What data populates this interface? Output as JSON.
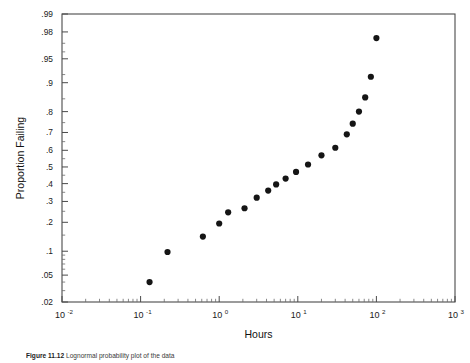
{
  "figure": {
    "caption_label": "Figure 11.12",
    "caption_text": "Lognormal probability plot of the data"
  },
  "chart_data": {
    "type": "scatter",
    "title": "",
    "subtitle": "",
    "xlabel": "Hours",
    "ylabel": "Proportion Failing",
    "x_scale": "log10",
    "y_scale": "normal-probability",
    "grid": false,
    "legend": null,
    "xlim": [
      0.01,
      1000
    ],
    "ylim": [
      0.02,
      0.99
    ],
    "x_ticks": [
      {
        "value": 0.01,
        "label": "10",
        "exponent": "-2"
      },
      {
        "value": 0.1,
        "label": "10",
        "exponent": "-1"
      },
      {
        "value": 1,
        "label": "10",
        "exponent": "0"
      },
      {
        "value": 10,
        "label": "10",
        "exponent": "1"
      },
      {
        "value": 100,
        "label": "10",
        "exponent": "2"
      },
      {
        "value": 1000,
        "label": "10",
        "exponent": "3"
      }
    ],
    "y_ticks": [
      {
        "value": 0.99,
        "label": ".99"
      },
      {
        "value": 0.98,
        "label": ".98"
      },
      {
        "value": 0.95,
        "label": ".95"
      },
      {
        "value": 0.9,
        "label": ".9"
      },
      {
        "value": 0.8,
        "label": ".8"
      },
      {
        "value": 0.7,
        "label": ".7"
      },
      {
        "value": 0.6,
        "label": ".6"
      },
      {
        "value": 0.5,
        "label": ".5"
      },
      {
        "value": 0.4,
        "label": ".4"
      },
      {
        "value": 0.3,
        "label": ".3"
      },
      {
        "value": 0.2,
        "label": ".2"
      },
      {
        "value": 0.1,
        "label": ".1"
      },
      {
        "value": 0.05,
        "label": ".05"
      },
      {
        "value": 0.02,
        "label": ".02"
      }
    ],
    "x": [
      0.13,
      0.22,
      0.62,
      1.0,
      1.3,
      2.1,
      3.0,
      4.2,
      5.3,
      7.0,
      9.5,
      13.5,
      20.0,
      30.0,
      42.0,
      50.0,
      60.0,
      72.0,
      85.0,
      100.0
    ],
    "y": [
      0.04,
      0.098,
      0.145,
      0.195,
      0.245,
      0.265,
      0.32,
      0.36,
      0.395,
      0.43,
      0.47,
      0.515,
      0.57,
      0.615,
      0.69,
      0.745,
      0.8,
      0.855,
      0.915,
      0.975
    ],
    "series": [
      {
        "name": "Failure data",
        "marker": "filled-circle",
        "marker_color": "#151515",
        "marker_size": 4.2,
        "points": [
          {
            "x": 0.13,
            "y": 0.04
          },
          {
            "x": 0.22,
            "y": 0.098
          },
          {
            "x": 0.62,
            "y": 0.145
          },
          {
            "x": 1.0,
            "y": 0.195
          },
          {
            "x": 1.3,
            "y": 0.245
          },
          {
            "x": 2.1,
            "y": 0.265
          },
          {
            "x": 3.0,
            "y": 0.32
          },
          {
            "x": 4.2,
            "y": 0.36
          },
          {
            "x": 5.3,
            "y": 0.395
          },
          {
            "x": 7.0,
            "y": 0.43
          },
          {
            "x": 9.5,
            "y": 0.47
          },
          {
            "x": 13.5,
            "y": 0.515
          },
          {
            "x": 20.0,
            "y": 0.57
          },
          {
            "x": 30.0,
            "y": 0.615
          },
          {
            "x": 42.0,
            "y": 0.69
          },
          {
            "x": 50.0,
            "y": 0.745
          },
          {
            "x": 60.0,
            "y": 0.8
          },
          {
            "x": 72.0,
            "y": 0.855
          },
          {
            "x": 85.0,
            "y": 0.915
          },
          {
            "x": 100.0,
            "y": 0.975
          }
        ]
      }
    ],
    "colors": {
      "marker": "#151515",
      "axis": "#4a4a4a",
      "text": "#1a1a1a",
      "background": "#ffffff"
    }
  }
}
